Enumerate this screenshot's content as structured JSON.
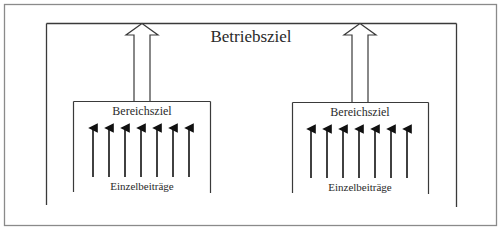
{
  "diagram": {
    "title": "Betriebsziel",
    "colors": {
      "outer_frame": "#8a8a8a",
      "lines": "#3a3a3a",
      "arrows": "#111111",
      "text": "#2a2a2a",
      "background": "#ffffff"
    },
    "areas": [
      {
        "title": "Bereichsziel",
        "footer": "Einzelbeiträge",
        "arrow_count": 7
      },
      {
        "title": "Bereichsziel",
        "footer": "Einzelbeiträge",
        "arrow_count": 7
      }
    ]
  }
}
